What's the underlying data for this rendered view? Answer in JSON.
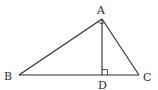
{
  "diagram": {
    "type": "geometry-triangle",
    "stroke_color": "#2b2b2b",
    "background": "#ffffff",
    "points": {
      "A": {
        "label": "A",
        "x": 102,
        "y": 19
      },
      "B": {
        "label": "B",
        "x": 19,
        "y": 75
      },
      "C": {
        "label": "C",
        "x": 139,
        "y": 75
      },
      "D": {
        "label": "D",
        "x": 102,
        "y": 75
      }
    },
    "segments": [
      {
        "name": "AB",
        "from": "A",
        "to": "B"
      },
      {
        "name": "AC",
        "from": "A",
        "to": "C"
      },
      {
        "name": "BC",
        "from": "B",
        "to": "C"
      },
      {
        "name": "AD",
        "from": "A",
        "to": "D",
        "role": "altitude"
      }
    ],
    "markers": {
      "right_angle_at": "D",
      "angle_arc_at": "A"
    },
    "labels": {
      "A": "A",
      "B": "B",
      "C": "C",
      "D": "D"
    }
  }
}
